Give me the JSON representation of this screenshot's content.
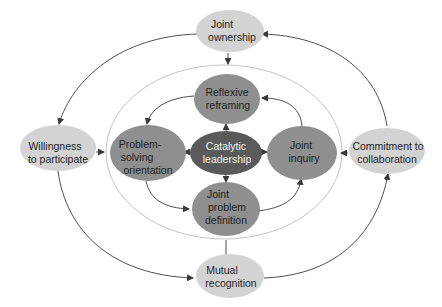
{
  "diagram": {
    "colors": {
      "outer_node": "#d3d3d3",
      "inner_node": "#8f8f8f",
      "center_node": "#5a5a5a",
      "arrow": "#3a3a3a",
      "ring": "#bdbdbd"
    },
    "outer_nodes": {
      "joint_ownership": {
        "line1": "Joint",
        "line2": "ownership"
      },
      "willingness": {
        "line1": "Willingness",
        "line2": "to participate"
      },
      "commitment": {
        "line1": "Commitment to",
        "line2": "collaboration"
      },
      "mutual_recognition": {
        "line1": "Mutual",
        "line2": "recognition"
      }
    },
    "inner_nodes": {
      "reflexive_reframing": {
        "line1": "Reflexive",
        "line2": "reframing"
      },
      "problem_solving": {
        "line1": "Problem-",
        "line2": "solving",
        "line3": "orientation"
      },
      "joint_inquiry": {
        "line1": "Joint",
        "line2": "inquiry"
      },
      "joint_problem_definition": {
        "line1": "Joint",
        "line2": "problem",
        "line3": "definition"
      }
    },
    "center_node": {
      "line1": "Catalytic",
      "line2": "leadership"
    },
    "edges": [
      {
        "from": "Joint ownership",
        "to": "Willingness to participate"
      },
      {
        "from": "Willingness to participate",
        "to": "Mutual recognition"
      },
      {
        "from": "Mutual recognition",
        "to": "Commitment to collaboration"
      },
      {
        "from": "Commitment to collaboration",
        "to": "Joint ownership"
      },
      {
        "from": "Reflexive reframing",
        "to": "Problem-solving orientation"
      },
      {
        "from": "Problem-solving orientation",
        "to": "Joint problem definition"
      },
      {
        "from": "Joint problem definition",
        "to": "Joint inquiry"
      },
      {
        "from": "Joint inquiry",
        "to": "Reflexive reframing"
      },
      {
        "from": "Catalytic leadership",
        "to": "Reflexive reframing"
      },
      {
        "from": "Catalytic leadership",
        "to": "Problem-solving orientation"
      },
      {
        "from": "Catalytic leadership",
        "to": "Joint inquiry"
      },
      {
        "from": "Catalytic leadership",
        "to": "Joint problem definition"
      },
      {
        "from": "Joint ownership",
        "to": "inner ring"
      },
      {
        "from": "Willingness to participate",
        "to": "inner ring"
      },
      {
        "from": "Commitment to collaboration",
        "to": "inner ring"
      }
    ]
  }
}
